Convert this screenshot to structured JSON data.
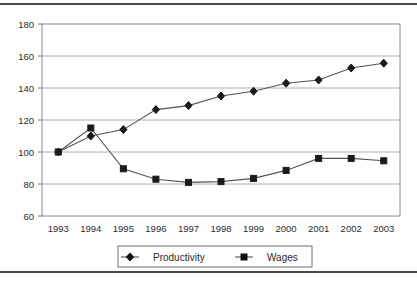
{
  "chart_data": {
    "type": "line",
    "title": "",
    "subtitle": "",
    "xlabel": "",
    "ylabel": "",
    "categories": [
      "1993",
      "1994",
      "1995",
      "1996",
      "1997",
      "1998",
      "1999",
      "2000",
      "2001",
      "2002",
      "2003"
    ],
    "x_tick_labels": [
      "1993",
      "1994",
      "1995",
      "1996",
      "1997",
      "1998",
      "1999",
      "2000",
      "2001",
      "2002",
      "2003"
    ],
    "y_tick_labels": [
      "60",
      "80",
      "100",
      "120",
      "140",
      "160",
      "180"
    ],
    "y_ticks": [
      60,
      80,
      100,
      120,
      140,
      160,
      180
    ],
    "ylim": [
      60,
      180
    ],
    "grid": "horizontal",
    "legend_position": "bottom",
    "series": [
      {
        "name": "Productivity",
        "marker": "diamond",
        "color": "#1a1a1a",
        "values": [
          100,
          110,
          114,
          126.5,
          129,
          135,
          138,
          143,
          145,
          152.5,
          155.5
        ]
      },
      {
        "name": "Wages",
        "marker": "square",
        "color": "#1a1a1a",
        "values": [
          100,
          115,
          89.5,
          83,
          81,
          81.5,
          83.5,
          88.5,
          96,
          96,
          94.5
        ]
      }
    ],
    "legend": [
      {
        "label": "Productivity",
        "marker": "diamond"
      },
      {
        "label": "Wages",
        "marker": "square"
      }
    ]
  },
  "colors": {
    "plot_border": "#8a8a8a",
    "gridline": "#b0b0b0",
    "series_line": "#555555",
    "marker": "#111111",
    "text": "#2b2b2b",
    "legend_border": "#6e6e6e",
    "scan_rule": "#4a4a4a"
  }
}
